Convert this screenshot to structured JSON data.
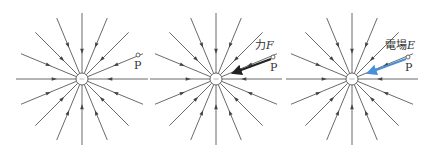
{
  "figure": {
    "panels": [
      {
        "id": "panel-1",
        "center": [
          82,
          79
        ],
        "charge_sign": "-",
        "point": {
          "label": "P",
          "pos": [
            138,
            55
          ]
        },
        "arrow": null
      },
      {
        "id": "panel-2",
        "center": [
          216,
          79
        ],
        "charge_sign": "-",
        "point": {
          "label": "P",
          "pos": [
            273,
            57
          ]
        },
        "arrow": {
          "label_prefix": "力",
          "label_symbol": "F",
          "color": "#222222",
          "from": [
            271,
            59
          ],
          "to": [
            233,
            73
          ]
        }
      },
      {
        "id": "panel-3",
        "center": [
          352,
          79
        ],
        "charge_sign": "-",
        "point": {
          "label": "P",
          "pos": [
            408,
            57
          ]
        },
        "arrow": {
          "label_prefix": "電場",
          "label_symbol": "E",
          "color": "#4a90d9",
          "from": [
            406,
            59
          ],
          "to": [
            368,
            73
          ]
        }
      }
    ],
    "field_lines": {
      "count": 16,
      "length": 66,
      "direction": "inward",
      "color": "#444444"
    },
    "charge_radius": 6
  }
}
